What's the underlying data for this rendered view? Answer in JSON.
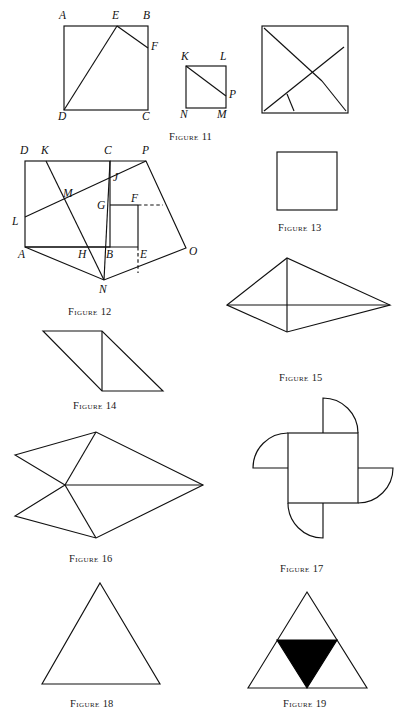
{
  "document": {
    "type": "geometry-figure-plate",
    "background_color": "#ffffff",
    "ink_color": "#111111",
    "fill_color": "#000000"
  },
  "captions": [
    {
      "id": "fig11",
      "word": "Figure",
      "number": "11",
      "x": 169,
      "y": 131
    },
    {
      "id": "fig12",
      "word": "Figure",
      "number": "12",
      "x": 68,
      "y": 306
    },
    {
      "id": "fig13",
      "word": "Figure",
      "number": "13",
      "x": 278,
      "y": 222
    },
    {
      "id": "fig14",
      "word": "Figure",
      "number": "14",
      "x": 73,
      "y": 400
    },
    {
      "id": "fig15",
      "word": "Figure",
      "number": "15",
      "x": 279,
      "y": 372
    },
    {
      "id": "fig16",
      "word": "Figure",
      "number": "16",
      "x": 69,
      "y": 553
    },
    {
      "id": "fig17",
      "word": "Figure",
      "number": "17",
      "x": 280,
      "y": 563
    },
    {
      "id": "fig18",
      "word": "Figure",
      "number": "18",
      "x": 70,
      "y": 698
    },
    {
      "id": "fig19",
      "word": "Figure",
      "number": "19",
      "x": 283,
      "y": 698
    }
  ],
  "figure11": {
    "caption": "Figure 11",
    "square_abcd": {
      "A": [
        64,
        26
      ],
      "B": [
        148,
        26
      ],
      "C": [
        148,
        110
      ],
      "D": [
        64,
        110
      ]
    },
    "point_E": [
      117,
      26
    ],
    "point_F": [
      148,
      48
    ],
    "segments": [
      [
        "D",
        "E"
      ],
      [
        "E",
        "F"
      ]
    ],
    "labels": [
      {
        "text": "A",
        "x": 59,
        "y": 13
      },
      {
        "text": "E",
        "x": 112,
        "y": 13
      },
      {
        "text": "B",
        "x": 143,
        "y": 13
      },
      {
        "text": "F",
        "x": 151,
        "y": 45
      },
      {
        "text": "D",
        "x": 58,
        "y": 114
      },
      {
        "text": "C",
        "x": 142,
        "y": 114
      }
    ],
    "square_klmn": {
      "K": [
        186,
        66
      ],
      "L": [
        226,
        66
      ],
      "M": [
        226,
        108
      ],
      "N": [
        186,
        108
      ]
    },
    "point_P": [
      226,
      96
    ],
    "klmn_segments": [
      [
        "K",
        "P"
      ]
    ],
    "klmn_labels": [
      {
        "text": "K",
        "x": 181,
        "y": 54
      },
      {
        "text": "L",
        "x": 220,
        "y": 54
      },
      {
        "text": "P",
        "x": 229,
        "y": 94
      },
      {
        "text": "N",
        "x": 180,
        "y": 112
      },
      {
        "text": "M",
        "x": 218,
        "y": 112
      }
    ],
    "dissected_square": {
      "bounds": {
        "x": 262,
        "y": 26,
        "w": 86,
        "h": 87
      },
      "cuts": [
        {
          "from": [
            264,
            111
          ],
          "to": [
            344,
            47
          ]
        },
        {
          "from": [
            264,
            28
          ],
          "to": [
            322,
            81
          ]
        },
        {
          "from": [
            287,
            94
          ],
          "to": [
            294,
            111
          ]
        },
        {
          "from": [
            322,
            81
          ],
          "to": [
            346,
            111
          ]
        }
      ]
    }
  },
  "figure12": {
    "caption": "Figure 12",
    "square_abcd": {
      "A": [
        25,
        247
      ],
      "B": [
        110,
        247
      ],
      "C": [
        110,
        161
      ],
      "D": [
        25,
        161
      ]
    },
    "outer_quad": {
      "A": [
        25,
        247
      ],
      "N": [
        104,
        280
      ],
      "O": [
        186,
        248
      ],
      "P": [
        146,
        161
      ]
    },
    "points": {
      "K": [
        46,
        161
      ],
      "L": [
        25,
        217
      ],
      "M": [
        70,
        199
      ],
      "J": [
        112,
        182
      ],
      "G": [
        110,
        205
      ],
      "F": [
        138,
        205
      ],
      "H": [
        85,
        247
      ],
      "E": [
        138,
        247
      ],
      "B": [
        110,
        247
      ],
      "N": [
        104,
        280
      ],
      "O": [
        186,
        248
      ],
      "P": [
        146,
        161
      ]
    },
    "solid_segments": [
      [
        "L",
        "P"
      ],
      [
        "K",
        "N"
      ],
      [
        "C",
        "N"
      ],
      [
        "G",
        "F"
      ],
      [
        "F",
        "E"
      ],
      [
        "A",
        "N"
      ],
      [
        "N",
        "O"
      ],
      [
        "O",
        "P"
      ],
      [
        "P",
        "C"
      ]
    ],
    "dashed_segments": [
      {
        "from": [
          138,
          205
        ],
        "to": [
          163,
          205
        ]
      },
      {
        "from": [
          138,
          247
        ],
        "to": [
          138,
          273
        ]
      }
    ],
    "labels": [
      {
        "text": "D",
        "x": 20,
        "y": 148
      },
      {
        "text": "K",
        "x": 41,
        "y": 148
      },
      {
        "text": "C",
        "x": 104,
        "y": 148
      },
      {
        "text": "P",
        "x": 142,
        "y": 148
      },
      {
        "text": "J",
        "x": 113,
        "y": 177
      },
      {
        "text": "M",
        "x": 64,
        "y": 194
      },
      {
        "text": "G",
        "x": 98,
        "y": 209
      },
      {
        "text": "F",
        "x": 132,
        "y": 200
      },
      {
        "text": "L",
        "x": 13,
        "y": 223
      },
      {
        "text": "H",
        "x": 79,
        "y": 254
      },
      {
        "text": "B",
        "x": 107,
        "y": 254
      },
      {
        "text": "E",
        "x": 140,
        "y": 254
      },
      {
        "text": "O",
        "x": 189,
        "y": 251
      },
      {
        "text": "A",
        "x": 19,
        "y": 254
      },
      {
        "text": "N",
        "x": 100,
        "y": 290
      }
    ]
  },
  "figure13": {
    "caption": "Figure 13",
    "square": {
      "x": 277,
      "y": 152,
      "w": 60,
      "h": 58
    }
  },
  "figure14": {
    "caption": "Figure 14",
    "parallelogram": [
      [
        43,
        331
      ],
      [
        102,
        331
      ],
      [
        163,
        391
      ],
      [
        102,
        391
      ]
    ],
    "divider": {
      "from": [
        102,
        331
      ],
      "to": [
        102,
        391
      ]
    }
  },
  "figure15": {
    "caption": "Figure 15",
    "kite": [
      [
        227,
        305
      ],
      [
        287,
        258
      ],
      [
        390,
        305
      ],
      [
        287,
        332
      ]
    ],
    "diagonals": [
      {
        "from": [
          227,
          305
        ],
        "to": [
          390,
          305
        ]
      },
      {
        "from": [
          287,
          258
        ],
        "to": [
          287,
          332
        ]
      }
    ]
  },
  "figure16": {
    "caption": "Figure 16",
    "dart": [
      [
        15,
        455
      ],
      [
        96,
        432
      ],
      [
        203,
        485
      ],
      [
        96,
        538
      ],
      [
        15,
        516
      ],
      [
        65,
        485
      ]
    ],
    "inner_segments": [
      {
        "from": [
          65,
          485
        ],
        "to": [
          96,
          432
        ]
      },
      {
        "from": [
          65,
          485
        ],
        "to": [
          203,
          485
        ]
      },
      {
        "from": [
          65,
          485
        ],
        "to": [
          96,
          538
        ]
      }
    ]
  },
  "figure17": {
    "caption": "Figure 17",
    "center_square": {
      "x": 288,
      "y": 433,
      "w": 70,
      "h": 70
    },
    "lobe_radius": 35,
    "lobes": [
      "top",
      "right",
      "bottom",
      "left"
    ]
  },
  "figure18": {
    "caption": "Figure 18",
    "triangle": [
      [
        100,
        583
      ],
      [
        160,
        684
      ],
      [
        42,
        684
      ]
    ]
  },
  "figure19": {
    "caption": "Figure 19",
    "triangle": [
      [
        307,
        592
      ],
      [
        367,
        688
      ],
      [
        248,
        688
      ]
    ],
    "inner_filled_triangle": [
      [
        277,
        640
      ],
      [
        337,
        640
      ],
      [
        307,
        688
      ]
    ],
    "inner_fill": "#000000"
  }
}
